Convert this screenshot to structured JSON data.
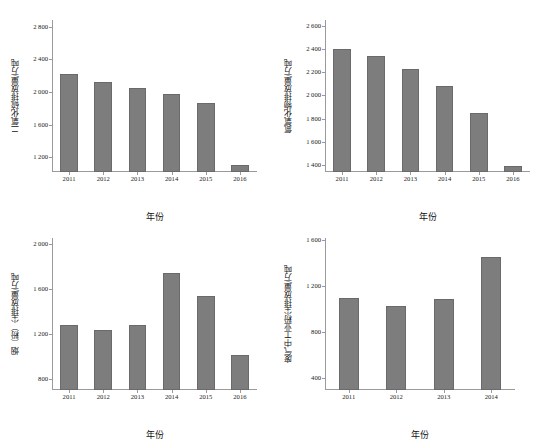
{
  "figure": {
    "background": "#ffffff",
    "bar_color": "#7d7d7d",
    "axis_color": "#9a9a9a",
    "panel_count": 4
  },
  "panels": [
    {
      "id": "panel-so2",
      "position": "top-left",
      "ylabel": "二氧化硫排放量/万吨",
      "xlabel": "年份",
      "ytick_labels": [
        "2 800",
        "2 400",
        "2 000",
        "1 600",
        "1 200"
      ],
      "xtick_labels": [
        "2011",
        "2012",
        "2013",
        "2014",
        "2015",
        "2016"
      ]
    },
    {
      "id": "panel-nox",
      "position": "top-right",
      "ylabel": "氮氧化物排放量/万吨",
      "xlabel": "年份",
      "ytick_labels": [
        "2 600",
        "2 400",
        "2 200",
        "2 000",
        "1 800",
        "1 600",
        "1 400"
      ],
      "xtick_labels": [
        "2011",
        "2012",
        "2013",
        "2014",
        "2015",
        "2016"
      ]
    },
    {
      "id": "panel-soot",
      "position": "bottom-left",
      "ylabel": "烟（粉）尘排放量/万吨",
      "xlabel": "年份",
      "ytick_labels": [
        "2 000",
        "1 600",
        "1 200",
        "800"
      ],
      "xtick_labels": [
        "2011",
        "2012",
        "2013",
        "2014",
        "2015",
        "2016"
      ]
    },
    {
      "id": "panel-indust-dust",
      "position": "bottom-right",
      "ylabel": "废气中工业粉尘排放量/万吨",
      "xlabel": "年份",
      "ytick_labels": [
        "1 600",
        "1 200",
        "800",
        "400"
      ],
      "xtick_labels": [
        "2011",
        "2012",
        "2013",
        "2014"
      ]
    }
  ],
  "chart_data": [
    {
      "type": "bar",
      "id": "panel-so2",
      "title": "",
      "xlabel": "年份",
      "ylabel": "二氧化硫排放量/万吨",
      "categories": [
        "2011",
        "2012",
        "2013",
        "2014",
        "2015",
        "2016"
      ],
      "values": [
        2218,
        2118,
        2044,
        1974,
        1859,
        1102
      ],
      "yticks": [
        1200,
        1600,
        2000,
        2400,
        2800
      ],
      "ylim": [
        1020,
        2880
      ],
      "grid": false,
      "legend": "none"
    },
    {
      "type": "bar",
      "id": "panel-nox",
      "title": "",
      "xlabel": "年份",
      "ylabel": "氮氧化物排放量/万吨",
      "categories": [
        "2011",
        "2012",
        "2013",
        "2014",
        "2015",
        "2016"
      ],
      "values": [
        2404,
        2338,
        2227,
        2078,
        1852,
        1394
      ],
      "yticks": [
        1400,
        1600,
        1800,
        2000,
        2200,
        2400,
        2600
      ],
      "ylim": [
        1340,
        2650
      ],
      "grid": false,
      "legend": "none"
    },
    {
      "type": "bar",
      "id": "panel-soot",
      "title": "",
      "xlabel": "年份",
      "ylabel": "烟（粉）尘排放量/万吨",
      "categories": [
        "2011",
        "2012",
        "2013",
        "2014",
        "2015",
        "2016"
      ],
      "values": [
        1279,
        1236,
        1278,
        1741,
        1538,
        1011
      ],
      "yticks": [
        800,
        1200,
        1600,
        2000
      ],
      "ylim": [
        700,
        2050
      ],
      "grid": false,
      "legend": "none"
    },
    {
      "type": "bar",
      "id": "panel-indust-dust",
      "title": "",
      "xlabel": "年份",
      "ylabel": "废气中工业粉尘排放量/万吨",
      "categories": [
        "2011",
        "2012",
        "2013",
        "2014"
      ],
      "values": [
        1101,
        1029,
        1094,
        1456
      ],
      "yticks": [
        400,
        800,
        1200,
        1600
      ],
      "ylim": [
        300,
        1620
      ],
      "grid": false,
      "legend": "none"
    }
  ]
}
